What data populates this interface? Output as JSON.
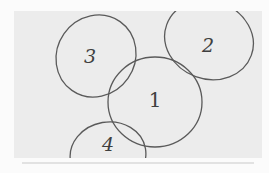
{
  "diagram": {
    "type": "hand-drawn overlapping circles sketch",
    "background_color": "#ececec",
    "stroke_color": "#5a5a5a",
    "circles": [
      {
        "id": "1",
        "label": "1",
        "cx": 155,
        "cy": 102,
        "rx": 47,
        "ry": 45,
        "rotate": 0,
        "label_x": 155,
        "label_y": 101
      },
      {
        "id": "2",
        "label": "2",
        "cx": 209,
        "cy": 40,
        "rx": 45,
        "ry": 39,
        "rotate": 20,
        "label_x": 208,
        "label_y": 47
      },
      {
        "id": "3",
        "label": "3",
        "cx": 96,
        "cy": 56,
        "rx": 39,
        "ry": 42,
        "rotate": 35,
        "label_x": 90,
        "label_y": 58
      },
      {
        "id": "4",
        "label": "4",
        "cx": 108,
        "cy": 155,
        "rx": 38,
        "ry": 33,
        "rotate": -10,
        "label_x": 108,
        "label_y": 146
      }
    ]
  }
}
